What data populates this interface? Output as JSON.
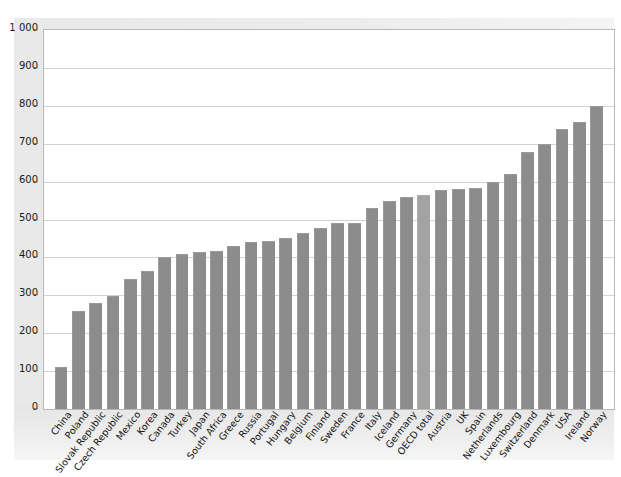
{
  "chart_data": {
    "type": "bar",
    "title": "",
    "xlabel": "",
    "ylabel": "Kg per capita",
    "ylim": [
      0,
      1000
    ],
    "grid": true,
    "legend": "none",
    "ytick_labels": [
      "1 000",
      "900",
      "800",
      "700",
      "600",
      "500",
      "400",
      "300",
      "200",
      "100",
      "0"
    ],
    "ytick_values": [
      1000,
      900,
      800,
      700,
      600,
      500,
      400,
      300,
      200,
      100,
      0
    ],
    "categories": [
      "China",
      "Poland",
      "Slovak Republic",
      "Czech Republic",
      "Mexico",
      "Korea",
      "Canada",
      "Turkey",
      "Japan",
      "South Africa",
      "Greece",
      "Russia",
      "Portugal",
      "Hungary",
      "Belgium",
      "Finland",
      "Sweden",
      "France",
      "Italy",
      "Iceland",
      "Germany",
      "OECD total",
      "Austria",
      "UK",
      "Spain",
      "Netherlands",
      "Luxembourg",
      "Switzerland",
      "Denmark",
      "USA",
      "Ireland",
      "Norway"
    ],
    "values": [
      112,
      259,
      280,
      297,
      343,
      363,
      402,
      410,
      415,
      416,
      430,
      440,
      442,
      450,
      465,
      478,
      490,
      492,
      530,
      548,
      560,
      565,
      577,
      580,
      583,
      598,
      620,
      677,
      700,
      740,
      757,
      800
    ],
    "highlight_category": "OECD total",
    "bar_color": "#8c8c8c",
    "highlight_color": "#a3a3a3",
    "grid_color": "#d2d2d2",
    "plot_background": "#ffffff",
    "figure_background": "#ececec"
  }
}
